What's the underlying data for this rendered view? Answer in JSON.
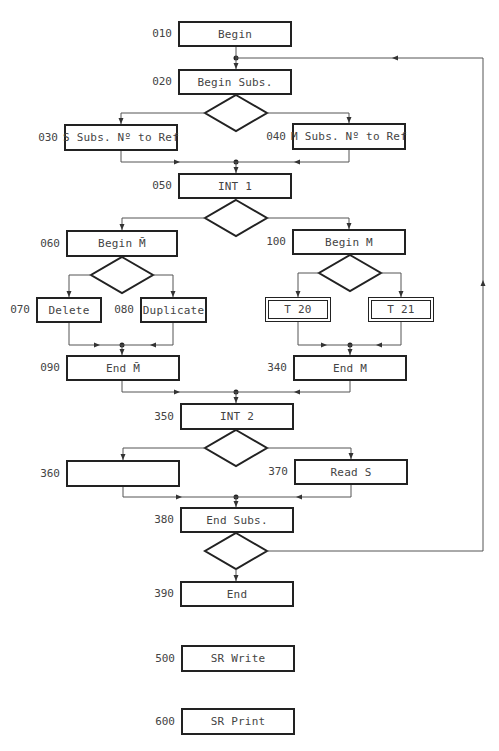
{
  "flowchart": {
    "nodes": [
      {
        "id": "n010",
        "step": "010",
        "label": "Begin",
        "x": 178,
        "y": 21,
        "w": 114,
        "h": 26,
        "style": "single"
      },
      {
        "id": "n020",
        "step": "020",
        "label": "Begin Subs.",
        "x": 178,
        "y": 69,
        "w": 114,
        "h": 26,
        "style": "single"
      },
      {
        "id": "n030",
        "step": "030",
        "label": "S Subs. Nº to Ref",
        "x": 64,
        "y": 124,
        "w": 114,
        "h": 27,
        "style": "single"
      },
      {
        "id": "n040",
        "step": "040",
        "label": "M Subs. Nº to Ref",
        "x": 292,
        "y": 123,
        "w": 114,
        "h": 27,
        "style": "single"
      },
      {
        "id": "n050",
        "step": "050",
        "label": "INT 1",
        "x": 178,
        "y": 173,
        "w": 114,
        "h": 26,
        "style": "single"
      },
      {
        "id": "n060",
        "step": "060",
        "label": "Begin M̄",
        "x": 66,
        "y": 230,
        "w": 112,
        "h": 27,
        "style": "single"
      },
      {
        "id": "n100",
        "step": "100",
        "label": "Begin M",
        "x": 292,
        "y": 229,
        "w": 114,
        "h": 26,
        "style": "single"
      },
      {
        "id": "n070",
        "step": "070",
        "label": "Delete",
        "x": 36,
        "y": 297,
        "w": 66,
        "h": 26,
        "style": "single"
      },
      {
        "id": "n080",
        "step": "080",
        "label": "Duplicate",
        "x": 140,
        "y": 297,
        "w": 67,
        "h": 26,
        "style": "single"
      },
      {
        "id": "nT20",
        "step": "",
        "label": "T 20",
        "x": 265,
        "y": 297,
        "w": 66,
        "h": 25,
        "style": "double"
      },
      {
        "id": "nT21",
        "step": "",
        "label": "T 21",
        "x": 368,
        "y": 297,
        "w": 66,
        "h": 25,
        "style": "double"
      },
      {
        "id": "n090",
        "step": "090",
        "label": "End M̄",
        "x": 66,
        "y": 355,
        "w": 114,
        "h": 26,
        "style": "single"
      },
      {
        "id": "n340",
        "step": "340",
        "label": "End M",
        "x": 293,
        "y": 355,
        "w": 114,
        "h": 26,
        "style": "single"
      },
      {
        "id": "n350",
        "step": "350",
        "label": "INT 2",
        "x": 180,
        "y": 403,
        "w": 114,
        "h": 27,
        "style": "single"
      },
      {
        "id": "n360",
        "step": "360",
        "label": "",
        "x": 66,
        "y": 460,
        "w": 114,
        "h": 27,
        "style": "single"
      },
      {
        "id": "n370",
        "step": "370",
        "label": "Read S",
        "x": 294,
        "y": 459,
        "w": 114,
        "h": 26,
        "style": "single"
      },
      {
        "id": "n380",
        "step": "380",
        "label": "End Subs.",
        "x": 180,
        "y": 507,
        "w": 114,
        "h": 26,
        "style": "single"
      },
      {
        "id": "n390",
        "step": "390",
        "label": "End",
        "x": 180,
        "y": 581,
        "w": 114,
        "h": 26,
        "style": "single"
      },
      {
        "id": "n500",
        "step": "500",
        "label": "SR Write",
        "x": 181,
        "y": 645,
        "w": 114,
        "h": 27,
        "style": "single"
      },
      {
        "id": "n600",
        "step": "600",
        "label": "SR Print",
        "x": 181,
        "y": 708,
        "w": 114,
        "h": 27,
        "style": "single"
      }
    ],
    "decisions": [
      {
        "id": "d1",
        "after": "020",
        "cx": 236,
        "cy": 113,
        "hw": 31,
        "hh": 18
      },
      {
        "id": "d2",
        "after": "050",
        "cx": 236,
        "cy": 218,
        "hw": 31,
        "hh": 18
      },
      {
        "id": "d3",
        "after": "060",
        "cx": 122,
        "cy": 275,
        "hw": 31,
        "hh": 18
      },
      {
        "id": "d4",
        "after": "100",
        "cx": 350,
        "cy": 273,
        "hw": 31,
        "hh": 18
      },
      {
        "id": "d5",
        "after": "350",
        "cx": 236,
        "cy": 448,
        "hw": 31,
        "hh": 18
      },
      {
        "id": "d6",
        "after": "380",
        "cx": 236,
        "cy": 551,
        "hw": 31,
        "hh": 18
      }
    ],
    "junctions": [
      {
        "x": 236,
        "y": 58
      },
      {
        "x": 236,
        "y": 162
      },
      {
        "x": 122,
        "y": 345
      },
      {
        "x": 350,
        "y": 345
      },
      {
        "x": 236,
        "y": 392
      },
      {
        "x": 236,
        "y": 497
      }
    ],
    "loop_back": {
      "from": "380 decision",
      "to": "020",
      "right_x": 483
    }
  }
}
